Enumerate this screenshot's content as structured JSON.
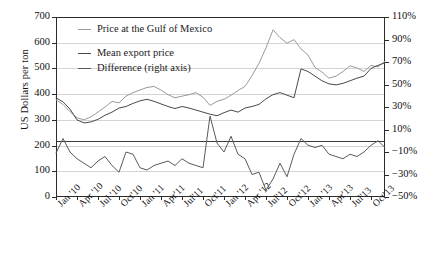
{
  "chart_data": {
    "type": "line",
    "title": "",
    "xlabel": "",
    "ylabel": "US Dollars per ton",
    "ylabel_right": "",
    "ylim": [
      0,
      700
    ],
    "ylim_right": [
      -50,
      110
    ],
    "grid": true,
    "legend_position": "top-left-inside",
    "yticks": [
      "0",
      "100",
      "200",
      "300",
      "400",
      "500",
      "600",
      "700"
    ],
    "yticks_right": [
      "-50%",
      "-30%",
      "-10%",
      "10%",
      "30%",
      "50%",
      "70%",
      "90%",
      "110%"
    ],
    "categories": [
      "Jan '10",
      "Feb '10",
      "Mar '10",
      "Apr '10",
      "May '10",
      "Jun '10",
      "Jul '10",
      "Aug '10",
      "Sep '10",
      "Oct '10",
      "Nov '10",
      "Dec '10",
      "Jan '11",
      "Feb '11",
      "Mar '11",
      "Apr '11",
      "May '11",
      "Jun '11",
      "Jul '11",
      "Aug '11",
      "Sep '11",
      "Oct '11",
      "Nov '11",
      "Dec '11",
      "Jan '12",
      "Feb '12",
      "Mar '12",
      "Apr '12",
      "May '12",
      "Jun '12",
      "Jul '12",
      "Aug '12",
      "Sep '12",
      "Oct '12",
      "Nov '12",
      "Dec '12",
      "Jan '13",
      "Feb '13",
      "Mar '13",
      "Apr '13",
      "May '13",
      "Jun '13",
      "Jul '13",
      "Aug '13",
      "Sep '13",
      "Oct '13",
      "Nov '13",
      "Dec '13"
    ],
    "xtick_labels": [
      "Jan '10",
      "Apr '10",
      "Jul '10",
      "Oct'10",
      "Jan '11",
      "Apr'11",
      "Jul'11",
      "Oct'11",
      "Jan '12",
      "Apr '12",
      "Jul'12",
      "Oct'12",
      "Jan '13",
      "Apr'13",
      "Jul'13",
      "Oct'13"
    ],
    "xtick_indices": [
      0,
      3,
      6,
      9,
      12,
      15,
      18,
      21,
      24,
      27,
      30,
      33,
      36,
      39,
      42,
      45
    ],
    "series": [
      {
        "name": "Price at the Gulf of Mexico",
        "axis": "left",
        "color": "#9a9a9a",
        "values": [
          378,
          360,
          332,
          308,
          300,
          312,
          330,
          350,
          372,
          366,
          392,
          406,
          416,
          426,
          430,
          416,
          398,
          386,
          392,
          398,
          406,
          388,
          356,
          372,
          380,
          396,
          414,
          430,
          472,
          520,
          580,
          650,
          620,
          598,
          612,
          576,
          552,
          504,
          486,
          462,
          470,
          488,
          510,
          502,
          488,
          512,
          506,
          528
        ]
      },
      {
        "name": "Mean export price",
        "axis": "left",
        "color": "#4a4a4a",
        "values": [
          386,
          370,
          342,
          300,
          288,
          292,
          302,
          318,
          330,
          346,
          352,
          364,
          374,
          380,
          372,
          362,
          352,
          344,
          352,
          346,
          338,
          330,
          322,
          316,
          328,
          338,
          330,
          346,
          352,
          360,
          382,
          398,
          406,
          396,
          386,
          498,
          488,
          470,
          452,
          440,
          436,
          442,
          452,
          462,
          470,
          500,
          512,
          522
        ]
      },
      {
        "name": "Difference (right axis)",
        "axis": "right",
        "color": "#5a5a5a",
        "values": [
          -11,
          2,
          -10,
          -16,
          -20,
          -24,
          -18,
          -14,
          -22,
          -28,
          -10,
          -12,
          -24,
          -26,
          -22,
          -20,
          -18,
          -22,
          -16,
          -20,
          -22,
          -24,
          22,
          -2,
          -10,
          4,
          -12,
          -16,
          -30,
          -28,
          -44,
          -34,
          -20,
          -32,
          -12,
          2,
          -4,
          -6,
          -4,
          -12,
          -14,
          -16,
          -12,
          -14,
          -10,
          -4,
          0,
          -6
        ]
      }
    ]
  },
  "legend": {
    "items": [
      {
        "label": "Price at the Gulf of Mexico"
      },
      {
        "label": "Mean export price"
      },
      {
        "label": "Difference (right axis)"
      }
    ]
  }
}
